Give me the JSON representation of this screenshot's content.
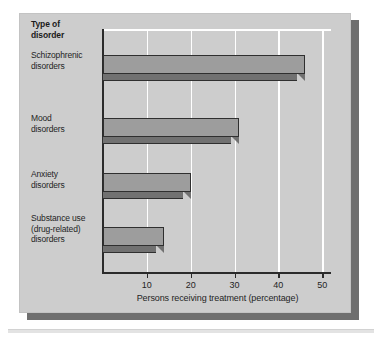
{
  "chart_data": {
    "type": "bar",
    "orientation": "horizontal",
    "title": "",
    "category_header": "Type of\ndisorder",
    "categories": [
      "Schizophrenic\ndisorders",
      "Mood\ndisorders",
      "Anxiety\ndisorders",
      "Substance use\n(drug-related)\ndisorders"
    ],
    "category_lines": [
      [
        "Schizophrenic",
        "disorders"
      ],
      [
        "Mood",
        "disorders"
      ],
      [
        "Anxiety",
        "disorders"
      ],
      [
        "Substance use",
        "(drug-related)",
        "disorders"
      ]
    ],
    "values": [
      46,
      31,
      20,
      14
    ],
    "xlabel": "Persons receiving treatment (percentage)",
    "ylabel": "Type of disorder",
    "xlim": [
      0,
      52
    ],
    "xticks": [
      10,
      20,
      30,
      40,
      50
    ],
    "xtick_labels": [
      "10",
      "20",
      "30",
      "40",
      "50"
    ],
    "grid": "vertical-white",
    "legend": "none",
    "style": "3d-extruded-bars"
  },
  "header": {
    "line1": "Type of",
    "line2": "disorder"
  },
  "axis": {
    "xlabel": "Persons receiving treatment (percentage)"
  },
  "colors": {
    "panel_background": "#cdcdcd",
    "panel_shadow": "#6f6f6f",
    "bar_face": "#9d9d9d",
    "bar_shade": "#717171",
    "bar_outline": "#2f2f2f",
    "gridline": "#ffffff",
    "axis": "#2b2b2b",
    "text": "#1f1f1f",
    "page_background": "#ffffff"
  }
}
